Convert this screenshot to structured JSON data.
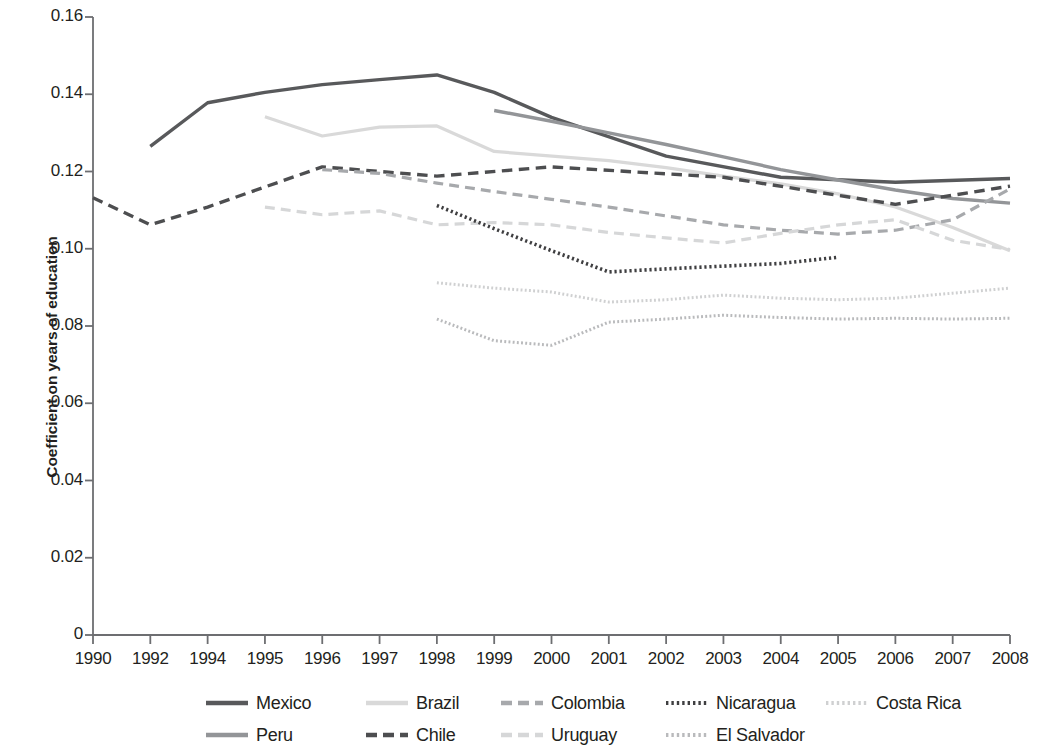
{
  "axes": {
    "ylabel": "Coefficient on years of education",
    "y_ticks": [
      "0.16",
      "0.14",
      "0.12",
      "0.10",
      "0.08",
      "0.06",
      "0.04",
      "0.02",
      "0"
    ],
    "x_ticks": [
      "1990",
      "1992",
      "1994",
      "1995",
      "1996",
      "1997",
      "1998",
      "1999",
      "2000",
      "2001",
      "2002",
      "2003",
      "2004",
      "2005",
      "2006",
      "2007",
      "2008"
    ]
  },
  "legend": {
    "row1": [
      {
        "name": "Mexico",
        "style": "solid-dark",
        "color": "#58595b"
      },
      {
        "name": "Brazil",
        "style": "solid-light",
        "color": "#d9d9d9"
      },
      {
        "name": "Colombia",
        "style": "dashed-mid",
        "color": "#a7a9ac"
      },
      {
        "name": "Nicaragua",
        "style": "dotted-dark",
        "color": "#3f3f41"
      },
      {
        "name": "Costa Rica",
        "style": "dotted-light",
        "color": "#cfd0d1"
      }
    ],
    "row2": [
      {
        "name": "Peru",
        "style": "solid-mid",
        "color": "#939598"
      },
      {
        "name": "Chile",
        "style": "dashed-dark",
        "color": "#4d4e50"
      },
      {
        "name": "Uruguay",
        "style": "dashed-light",
        "color": "#d6d7d8"
      },
      {
        "name": "El Salvador",
        "style": "dotted-mid",
        "color": "#b9babc"
      }
    ]
  },
  "chart_data": {
    "type": "line",
    "title": "",
    "xlabel": "",
    "ylabel": "Coefficient on years of education",
    "ylim": [
      0,
      0.16
    ],
    "grid": false,
    "legend_position": "bottom",
    "categories": [
      "1990",
      "1992",
      "1994",
      "1995",
      "1996",
      "1997",
      "1998",
      "1999",
      "2000",
      "2001",
      "2002",
      "2003",
      "2004",
      "2005",
      "2006",
      "2007",
      "2008"
    ],
    "series": [
      {
        "name": "Mexico",
        "color": "#58595b",
        "dash": "solid",
        "width": 3.4,
        "x": [
          "1992",
          "1994",
          "1995",
          "1996",
          "1997",
          "1998",
          "1999",
          "2000",
          "2002",
          "2004",
          "2006",
          "2008"
        ],
        "values": [
          0.1265,
          0.1378,
          0.1405,
          0.1425,
          0.1438,
          0.145,
          0.1405,
          0.134,
          0.124,
          0.1185,
          0.1172,
          0.1182
        ]
      },
      {
        "name": "Peru",
        "color": "#939598",
        "dash": "solid",
        "width": 3.4,
        "x": [
          "1999",
          "2000",
          "2001",
          "2002",
          "2003",
          "2004",
          "2005",
          "2006",
          "2007",
          "2008"
        ],
        "values": [
          0.1358,
          0.133,
          0.13,
          0.127,
          0.1238,
          0.1205,
          0.1178,
          0.1152,
          0.113,
          0.1118
        ]
      },
      {
        "name": "Brazil",
        "color": "#d9d9d9",
        "dash": "solid",
        "width": 3.2,
        "x": [
          "1995",
          "1996",
          "1997",
          "1998",
          "1999",
          "2001",
          "2002",
          "2003",
          "2004",
          "2005",
          "2006",
          "2007",
          "2008"
        ],
        "values": [
          0.1342,
          0.1292,
          0.1315,
          0.1318,
          0.1252,
          0.1228,
          0.121,
          0.1188,
          0.1168,
          0.1142,
          0.1108,
          0.1055,
          0.0995
        ]
      },
      {
        "name": "Chile",
        "color": "#4d4e50",
        "dash": "dashed",
        "width": 3.4,
        "x": [
          "1990",
          "1992",
          "1994",
          "1996",
          "1998",
          "2000",
          "2003",
          "2006",
          "2008"
        ],
        "values": [
          0.1132,
          0.1062,
          0.1108,
          0.1212,
          0.1188,
          0.1212,
          0.1185,
          0.1115,
          0.1162
        ]
      },
      {
        "name": "Colombia",
        "color": "#a7a9ac",
        "dash": "dashed",
        "width": 3.2,
        "x": [
          "1996",
          "1997",
          "1998",
          "1999",
          "2000",
          "2001",
          "2002",
          "2003",
          "2004",
          "2005",
          "2006",
          "2007",
          "2008"
        ],
        "values": [
          0.1205,
          0.1195,
          0.117,
          0.1148,
          0.1128,
          0.1108,
          0.1085,
          0.1062,
          0.1048,
          0.1038,
          0.1048,
          0.1075,
          0.1155
        ]
      },
      {
        "name": "Uruguay",
        "color": "#d6d7d8",
        "dash": "dashed",
        "width": 3.2,
        "x": [
          "1995",
          "1996",
          "1997",
          "1998",
          "1999",
          "2000",
          "2001",
          "2002",
          "2003",
          "2004",
          "2005",
          "2006",
          "2007",
          "2008"
        ],
        "values": [
          0.1108,
          0.1088,
          0.1098,
          0.1062,
          0.1068,
          0.1062,
          0.1042,
          0.1028,
          0.1015,
          0.104,
          0.1062,
          0.1075,
          0.1022,
          0.0998
        ]
      },
      {
        "name": "Nicaragua",
        "color": "#3f3f41",
        "dash": "dotted",
        "width": 3.6,
        "x": [
          "1998",
          "1999",
          "2000",
          "2001",
          "2002",
          "2003",
          "2004",
          "2005"
        ],
        "values": [
          0.1112,
          0.1052,
          0.0995,
          0.094,
          0.0948,
          0.0955,
          0.0962,
          0.0978
        ]
      },
      {
        "name": "Costa Rica",
        "color": "#cfd0d1",
        "dash": "dotted",
        "width": 3.0,
        "x": [
          "1998",
          "1999",
          "2000",
          "2001",
          "2002",
          "2003",
          "2004",
          "2005",
          "2006",
          "2007",
          "2008"
        ],
        "values": [
          0.0912,
          0.0898,
          0.0888,
          0.0862,
          0.0868,
          0.088,
          0.0872,
          0.0868,
          0.0872,
          0.0885,
          0.0898
        ]
      },
      {
        "name": "El Salvador",
        "color": "#b9babc",
        "dash": "dotted",
        "width": 3.0,
        "x": [
          "1998",
          "1999",
          "2000",
          "2001",
          "2002",
          "2003",
          "2004",
          "2005",
          "2006",
          "2007",
          "2008"
        ],
        "values": [
          0.0818,
          0.0762,
          0.075,
          0.081,
          0.0818,
          0.0828,
          0.0822,
          0.0818,
          0.082,
          0.0818,
          0.082
        ]
      }
    ]
  }
}
